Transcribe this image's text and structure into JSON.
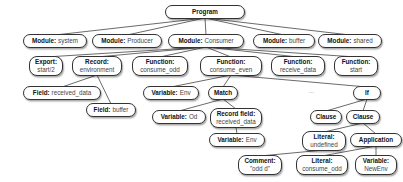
{
  "diagram": {
    "type": "tree",
    "title": "Program",
    "nodes": [
      {
        "id": "program",
        "kind": "Program",
        "value": "",
        "x": 165,
        "y": 5,
        "w": 80,
        "h": 14,
        "layout": "row"
      },
      {
        "id": "mod_system",
        "kind": "Module:",
        "value": "system",
        "x": 23,
        "y": 34,
        "w": 64,
        "h": 14,
        "layout": "row"
      },
      {
        "id": "mod_producer",
        "kind": "Module:",
        "value": "Producer",
        "x": 92,
        "y": 34,
        "w": 70,
        "h": 14,
        "layout": "row"
      },
      {
        "id": "mod_consumer",
        "kind": "Module:",
        "value": "Consumer",
        "x": 168,
        "y": 34,
        "w": 76,
        "h": 14,
        "layout": "row"
      },
      {
        "id": "mod_buffer",
        "kind": "Module:",
        "value": "buffer",
        "x": 253,
        "y": 34,
        "w": 62,
        "h": 14,
        "layout": "row"
      },
      {
        "id": "mod_shared",
        "kind": "Module:",
        "value": "shared",
        "x": 318,
        "y": 34,
        "w": 64,
        "h": 14,
        "layout": "row"
      },
      {
        "id": "export",
        "kind": "Export:",
        "value": "start/2",
        "x": 29,
        "y": 56,
        "w": 34,
        "h": 20,
        "layout": "col"
      },
      {
        "id": "record_env",
        "kind": "Record:",
        "value": "environment",
        "x": 72,
        "y": 56,
        "w": 50,
        "h": 20,
        "layout": "col"
      },
      {
        "id": "fn_consume_odd",
        "kind": "Function:",
        "value": "consume_odd",
        "x": 132,
        "y": 56,
        "w": 56,
        "h": 20,
        "layout": "col"
      },
      {
        "id": "fn_consume_even",
        "kind": "Function:",
        "value": "consume_even",
        "x": 200,
        "y": 56,
        "w": 62,
        "h": 20,
        "layout": "col"
      },
      {
        "id": "fn_receive_data",
        "kind": "Function:",
        "value": "receive_data",
        "x": 271,
        "y": 56,
        "w": 54,
        "h": 20,
        "layout": "col"
      },
      {
        "id": "fn_start",
        "kind": "Function:",
        "value": "start",
        "x": 334,
        "y": 56,
        "w": 44,
        "h": 20,
        "layout": "col"
      },
      {
        "id": "field_received",
        "kind": "Field:",
        "value": "received_data",
        "x": 23,
        "y": 86,
        "w": 78,
        "h": 14,
        "layout": "row"
      },
      {
        "id": "field_buffer",
        "kind": "Field:",
        "value": "buffer",
        "x": 86,
        "y": 103,
        "w": 50,
        "h": 14,
        "layout": "row"
      },
      {
        "id": "var_env1",
        "kind": "Variable:",
        "value": "Env",
        "x": 143,
        "y": 86,
        "w": 56,
        "h": 14,
        "layout": "row"
      },
      {
        "id": "match",
        "kind": "Match",
        "value": "",
        "x": 208,
        "y": 86,
        "w": 30,
        "h": 14,
        "layout": "row"
      },
      {
        "id": "var_od",
        "kind": "Variable:",
        "value": "Od",
        "x": 152,
        "y": 110,
        "w": 54,
        "h": 14,
        "layout": "row"
      },
      {
        "id": "record_field",
        "kind": "Record field:",
        "value": "received_data",
        "x": 210,
        "y": 108,
        "w": 52,
        "h": 20,
        "layout": "col"
      },
      {
        "id": "var_env2",
        "kind": "Variable:",
        "value": "Env",
        "x": 209,
        "y": 133,
        "w": 56,
        "h": 14,
        "layout": "row"
      },
      {
        "id": "if",
        "kind": "If",
        "value": "",
        "x": 353,
        "y": 86,
        "w": 28,
        "h": 14,
        "layout": "row"
      },
      {
        "id": "clause1",
        "kind": "Clause",
        "value": "",
        "x": 310,
        "y": 110,
        "w": 32,
        "h": 14,
        "layout": "row"
      },
      {
        "id": "clause2",
        "kind": "Clause",
        "value": "",
        "x": 346,
        "y": 110,
        "w": 34,
        "h": 14,
        "layout": "row"
      },
      {
        "id": "lit_undefined",
        "kind": "Literal:",
        "value": "undefined",
        "x": 302,
        "y": 131,
        "w": 44,
        "h": 20,
        "layout": "col"
      },
      {
        "id": "application",
        "kind": "Application",
        "value": "",
        "x": 350,
        "y": 133,
        "w": 52,
        "h": 14,
        "layout": "row"
      },
      {
        "id": "comment",
        "kind": "Comment:",
        "value": "\"odd d\"",
        "x": 238,
        "y": 155,
        "w": 44,
        "h": 20,
        "layout": "col"
      },
      {
        "id": "lit_consume_odd",
        "kind": "Literal:",
        "value": "consume_odd",
        "x": 296,
        "y": 155,
        "w": 52,
        "h": 20,
        "layout": "col"
      },
      {
        "id": "var_newenv",
        "kind": "Variable:",
        "value": "NewEnv",
        "x": 355,
        "y": 155,
        "w": 42,
        "h": 20,
        "layout": "col"
      }
    ],
    "edges": [
      [
        "program",
        "mod_system"
      ],
      [
        "program",
        "mod_producer"
      ],
      [
        "program",
        "mod_consumer"
      ],
      [
        "program",
        "mod_buffer"
      ],
      [
        "program",
        "mod_shared"
      ],
      [
        "mod_consumer",
        "export"
      ],
      [
        "mod_consumer",
        "record_env"
      ],
      [
        "mod_consumer",
        "fn_consume_odd"
      ],
      [
        "mod_consumer",
        "fn_consume_even"
      ],
      [
        "mod_consumer",
        "fn_receive_data"
      ],
      [
        "mod_consumer",
        "fn_start"
      ],
      [
        "record_env",
        "field_received"
      ],
      [
        "record_env",
        "field_buffer"
      ],
      [
        "fn_consume_even",
        "var_env1"
      ],
      [
        "fn_consume_even",
        "match"
      ],
      [
        "fn_consume_even",
        "if"
      ],
      [
        "match",
        "var_od"
      ],
      [
        "match",
        "record_field"
      ],
      [
        "record_field",
        "var_env2"
      ],
      [
        "if",
        "clause1"
      ],
      [
        "if",
        "clause2"
      ],
      [
        "clause2",
        "lit_undefined"
      ],
      [
        "clause2",
        "application"
      ],
      [
        "lit_undefined",
        "comment"
      ],
      [
        "application",
        "lit_consume_odd"
      ],
      [
        "application",
        "var_newenv"
      ]
    ],
    "ellipsis": {
      "label": "...",
      "x": 309,
      "y": 88
    },
    "colors": {
      "border": "#333333",
      "background": "#ffffff",
      "edge": "#444444"
    }
  }
}
